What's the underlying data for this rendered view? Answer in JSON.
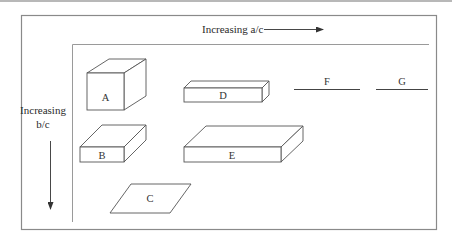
{
  "figure": {
    "x_axis_label": "Increasing a/c",
    "y_axis_label_line1": "Increasing",
    "y_axis_label_line2": "b/c",
    "colors": {
      "outer_frame": "#8a8a8a",
      "inner_axes": "#9a9a9a",
      "shape_stroke": "#555555",
      "text": "#2a2a2a"
    }
  },
  "shapes": [
    {
      "id": "A",
      "label": "A",
      "kind": "cube"
    },
    {
      "id": "B",
      "label": "B",
      "kind": "flat-box"
    },
    {
      "id": "C",
      "label": "C",
      "kind": "parallelogram"
    },
    {
      "id": "D",
      "label": "D",
      "kind": "long-bar"
    },
    {
      "id": "E",
      "label": "E",
      "kind": "wide-slab"
    },
    {
      "id": "F",
      "label": "F",
      "kind": "line"
    },
    {
      "id": "G",
      "label": "G",
      "kind": "line"
    }
  ]
}
